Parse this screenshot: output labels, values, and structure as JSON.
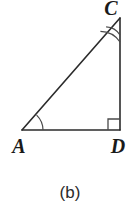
{
  "figure": {
    "name": "right-triangle-acd",
    "caption": "(b)",
    "background_color": "#ffffff",
    "stroke_color": "#2b2b2b",
    "arc_color": "#3a3a3a",
    "label_color": "#1a1a1a",
    "vertices": [
      {
        "id": "C",
        "label": "C",
        "x": 120,
        "y": 18,
        "label_x": 111,
        "label_y": 15
      },
      {
        "id": "A",
        "label": "A",
        "x": 22,
        "y": 130,
        "label_x": 13,
        "label_y": 153
      },
      {
        "id": "D",
        "label": "D",
        "x": 120,
        "y": 130,
        "label_x": 110,
        "label_y": 153
      }
    ],
    "sides": [
      {
        "id": "AC",
        "from": "A",
        "to": "C",
        "name": "hypotenuse-ac"
      },
      {
        "id": "CD",
        "from": "C",
        "to": "D",
        "name": "vertical-leg-cd"
      },
      {
        "id": "AD",
        "from": "A",
        "to": "D",
        "name": "horizontal-leg-ad"
      }
    ],
    "angle_marks": [
      {
        "at": "A",
        "type": "single-arc",
        "count": 1,
        "radius": 21
      },
      {
        "at": "C",
        "type": "double-arc",
        "count": 2,
        "radius_inner": 17,
        "radius_outer": 24
      },
      {
        "at": "D",
        "type": "right-angle-square",
        "size": 11
      }
    ]
  }
}
